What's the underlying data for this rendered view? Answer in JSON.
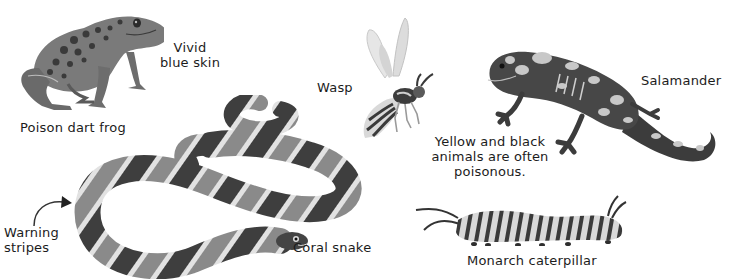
{
  "page": {
    "background": "#ffffff",
    "ink": "#1c1c1c"
  },
  "animals": {
    "frog": {
      "name": "Poison dart frog",
      "callout_line1": "Vivid",
      "callout_line2": "blue skin"
    },
    "wasp": {
      "name": "Wasp"
    },
    "salamander": {
      "name": "Salamander"
    },
    "snake": {
      "name": "Coral snake",
      "callout_line1": "Warning",
      "callout_line2": "stripes"
    },
    "caterpillar": {
      "name": "Monarch caterpillar"
    }
  },
  "note": {
    "line1": "Yellow and black",
    "line2": "animals are often",
    "line3": "poisonous."
  },
  "icons": {
    "arrow": "curved-arrow-icon"
  }
}
